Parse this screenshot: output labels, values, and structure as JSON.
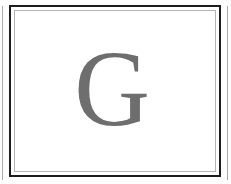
{
  "page": {
    "kind": "scanned-decorative-page",
    "background_color": "#fdfdfd",
    "width": 231,
    "height": 184
  },
  "edges": {
    "left_rule_color": "#9a9a9a",
    "right_rule_color": "#9a9a9a"
  },
  "frame": {
    "outer": {
      "name": "outer-dark-rule",
      "color": "#1d1d1f",
      "thickness": 2
    },
    "gap": {
      "name": "white-gap",
      "color": "#ffffff",
      "thickness": 3
    },
    "inner": {
      "name": "inner-light-rule",
      "color": "#b5b5b5",
      "thickness": 1
    },
    "fill_color": "#ffffff"
  },
  "content": {
    "drop_cap": {
      "character": "G",
      "color": "#6e6e6e",
      "style": "serif-capital"
    }
  }
}
